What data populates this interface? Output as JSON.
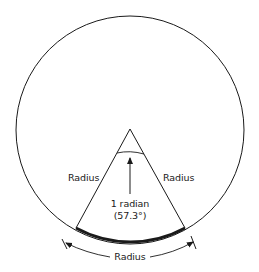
{
  "diagram": {
    "title": "",
    "labels": {
      "left_radius": "Radius",
      "right_radius": "Radius",
      "arc_length": "Radius",
      "angle_line1": "1 radian",
      "angle_line2": "(57.3°)"
    },
    "geometry": {
      "circle_center": [
        130,
        130
      ],
      "circle_radius": 114,
      "sector_angle_deg": 57.3
    },
    "colors": {
      "stroke": "#1a1a1a",
      "background": "#ffffff"
    }
  }
}
